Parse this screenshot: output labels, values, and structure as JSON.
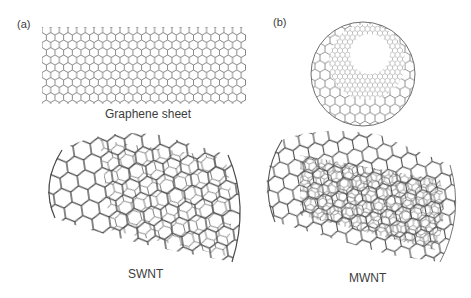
{
  "figure": {
    "panels": [
      {
        "tag": "(a)",
        "items": [
          {
            "label": "Graphene sheet"
          },
          {
            "label": "SWNT"
          }
        ]
      },
      {
        "tag": "(b)",
        "items": [
          {
            "label": "MWNT"
          }
        ]
      }
    ]
  },
  "colors": {
    "background": "#ffffff",
    "lattice_stroke": "#555555",
    "lattice_stroke_dark": "#3a3a3a",
    "lattice_stroke_light": "#9a9a9a",
    "label_text": "#3c3c3c"
  }
}
